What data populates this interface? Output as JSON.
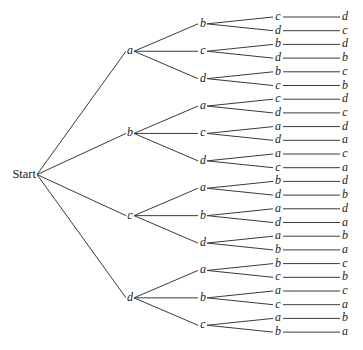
{
  "diagram": {
    "type": "tree",
    "root_label": "Start",
    "levels": 4,
    "tree": [
      {
        "label": "a",
        "children": [
          {
            "label": "b",
            "children": [
              {
                "label": "c",
                "leaf": "d"
              },
              {
                "label": "d",
                "leaf": "c"
              }
            ]
          },
          {
            "label": "c",
            "children": [
              {
                "label": "b",
                "leaf": "d"
              },
              {
                "label": "d",
                "leaf": "b"
              }
            ]
          },
          {
            "label": "d",
            "children": [
              {
                "label": "b",
                "leaf": "c"
              },
              {
                "label": "c",
                "leaf": "b"
              }
            ]
          }
        ]
      },
      {
        "label": "b",
        "children": [
          {
            "label": "a",
            "children": [
              {
                "label": "c",
                "leaf": "d"
              },
              {
                "label": "d",
                "leaf": "c"
              }
            ]
          },
          {
            "label": "c",
            "children": [
              {
                "label": "a",
                "leaf": "d"
              },
              {
                "label": "d",
                "leaf": "a"
              }
            ]
          },
          {
            "label": "d",
            "children": [
              {
                "label": "a",
                "leaf": "c"
              },
              {
                "label": "c",
                "leaf": "a"
              }
            ]
          }
        ]
      },
      {
        "label": "c",
        "children": [
          {
            "label": "a",
            "children": [
              {
                "label": "b",
                "leaf": "d"
              },
              {
                "label": "d",
                "leaf": "b"
              }
            ]
          },
          {
            "label": "b",
            "children": [
              {
                "label": "a",
                "leaf": "d"
              },
              {
                "label": "d",
                "leaf": "a"
              }
            ]
          },
          {
            "label": "d",
            "children": [
              {
                "label": "a",
                "leaf": "b"
              },
              {
                "label": "b",
                "leaf": "a"
              }
            ]
          }
        ]
      },
      {
        "label": "d",
        "children": [
          {
            "label": "a",
            "children": [
              {
                "label": "b",
                "leaf": "c"
              },
              {
                "label": "c",
                "leaf": "b"
              }
            ]
          },
          {
            "label": "b",
            "children": [
              {
                "label": "a",
                "leaf": "c"
              },
              {
                "label": "c",
                "leaf": "a"
              }
            ]
          },
          {
            "label": "c",
            "children": [
              {
                "label": "a",
                "leaf": "b"
              },
              {
                "label": "b",
                "leaf": "a"
              }
            ]
          }
        ]
      }
    ]
  }
}
